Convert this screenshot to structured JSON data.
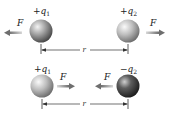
{
  "diagram": {
    "top_row": {
      "charge_left": {
        "sign": "+",
        "name": "q",
        "sub": "1"
      },
      "charge_right": {
        "sign": "+",
        "name": "q",
        "sub": "2"
      },
      "force_left": {
        "label": "F",
        "direction": "left"
      },
      "force_right": {
        "label": "F",
        "direction": "right"
      },
      "distance_label": "r",
      "relation": "repulsion"
    },
    "bottom_row": {
      "charge_left": {
        "sign": "+",
        "name": "q",
        "sub": "1"
      },
      "charge_right": {
        "sign": "−",
        "name": "q",
        "sub": "2"
      },
      "force_left": {
        "label": "F",
        "direction": "right"
      },
      "force_right": {
        "label": "F",
        "direction": "left"
      },
      "distance_label": "r",
      "relation": "attraction"
    },
    "colors": {
      "positive_charge": "#8a8a8a",
      "negative_charge": "#3a3a3a",
      "arrow": "#7a7a7a",
      "dimension_line": "#333333"
    }
  }
}
